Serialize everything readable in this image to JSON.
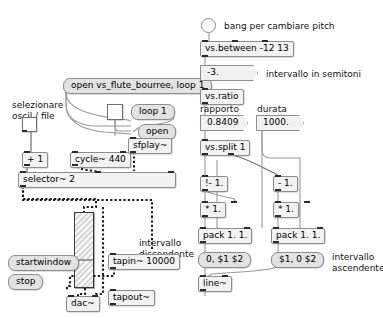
{
  "patch": {
    "title": "Pure Data patch",
    "canvas": {
      "width": 383,
      "height": 318,
      "background": "#ffffff"
    }
  },
  "colors": {
    "object_fill": "#f2f2f2",
    "message_fill": "#e3e3e3",
    "border": "#8d8d8d",
    "signal_cord": "#1b1b1b",
    "control_cord": "#9a9a9a",
    "widget_fill": "#ffffff"
  },
  "comments": {
    "selezionare": "selezionare",
    "oscil_file": "oscil / file",
    "bang_pitch": "bang per cambiare pitch",
    "intervallo_semitoni": "intervallo in semitoni",
    "rapporto": "rapporto",
    "durata": "durata",
    "intervallo_discendente_1": "intervallo",
    "intervallo_discendente_2": "discendente",
    "intervallo_ascendente_1": "intervallo",
    "intervallo_ascendente_2": "ascendente"
  },
  "objects": {
    "plus_one": "+ 1",
    "cycle": "cycle~ 440",
    "sfplay": "sfplay~",
    "selector": "selector~ 2",
    "vs_between": "vs.between -12 13",
    "vs_ratio": "vs.ratio",
    "vs_split": "vs.split 1",
    "inv_minus_left": "!- 1.",
    "minus_right": "- 1.",
    "times_left": "* 1.",
    "times_right": "* 1.",
    "pack_left": "pack 1. 1.",
    "pack_right": "pack 1. 1.",
    "line": "line~",
    "tapin": "tapin~ 10000",
    "tapout": "tapout~",
    "dac": "dac~"
  },
  "messages": {
    "open_file": "open vs_flute_bourree, loop 1",
    "loop_one": "loop 1",
    "open": "open",
    "ramp_down": "0, $1 $2",
    "ramp_up": "$1, 0 $2",
    "startwindow": "startwindow",
    "stop": "stop"
  },
  "numberboxes": {
    "semitones": "-3.",
    "ratio": "0.8409",
    "duration": "1000."
  },
  "widgets": {
    "toggle_oscil_file": {
      "name": "toggle",
      "state": "off"
    },
    "toggle_loop": {
      "name": "toggle",
      "state": "off"
    },
    "bang_pitch": {
      "name": "bang",
      "state": "off"
    },
    "volume_slider": {
      "name": "vslider",
      "value_position_pct": 55
    }
  }
}
